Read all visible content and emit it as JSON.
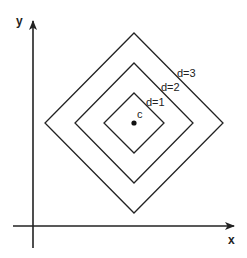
{
  "diagram": {
    "axes": {
      "x_label": "x",
      "y_label": "y"
    },
    "center": {
      "label": "c"
    },
    "contours": [
      {
        "label": "d=1",
        "distance": 1
      },
      {
        "label": "d=2",
        "distance": 2
      },
      {
        "label": "d=3",
        "distance": 3
      }
    ],
    "colors": {
      "stroke": "#222222",
      "background": "#ffffff"
    }
  }
}
